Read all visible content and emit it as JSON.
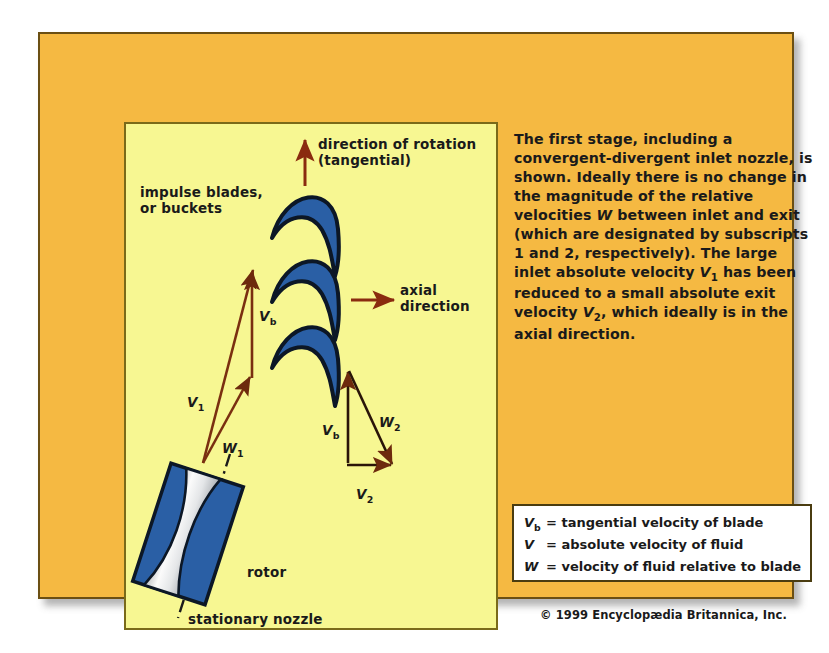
{
  "figure": {
    "colors": {
      "page_background": "#ffffff",
      "outer_panel": "#f5b942",
      "outer_panel_border": "#6b4f13",
      "inner_panel": "#f7f792",
      "inner_panel_border": "#7a6a1a",
      "blade_fill": "#2a5fa5",
      "blade_outline": "#0e1a33",
      "arrow_color": "#8a2b0f",
      "vector_color": "#7a2f10",
      "nozzle_blue": "#2a5fa5",
      "nozzle_white": "#f2f2f2",
      "legend_background": "#ffffff",
      "text_color": "#1a1a1a"
    }
  },
  "diagram": {
    "labels": {
      "rotation_arrow": "direction of rotation\n(tangential)",
      "impulse_blades": "impulse blades,\nor buckets",
      "axial_arrow": "axial\ndirection",
      "rotor": "rotor",
      "stationary_nozzle": "stationary nozzle"
    },
    "vectors": {
      "v1": "V",
      "v1_sub": "1",
      "w1": "W",
      "w1_sub": "1",
      "vb_left": "V",
      "vb_left_sub": "b",
      "vb_right": "V",
      "vb_right_sub": "b",
      "w2": "W",
      "w2_sub": "2",
      "v2": "V",
      "v2_sub": "2"
    },
    "blade_count": 3
  },
  "body": {
    "paragraph": "The first stage, including a convergent-divergent inlet nozzle, is shown. Ideally there is no change in the magnitude of the relative velocities W between inlet and exit (which are designated by subscripts 1 and 2, respectively). The large inlet absolute velocity V1 has been reduced to a small absolute exit velocity V2, which ideally is in the axial direction."
  },
  "legend": {
    "rows": [
      {
        "symbol": "V",
        "subscript": "b",
        "definition": "= tangential velocity of blade"
      },
      {
        "symbol": "V",
        "subscript": "",
        "definition": "= absolute velocity of fluid"
      },
      {
        "symbol": "W",
        "subscript": "",
        "definition": "= velocity of fluid relative to blade"
      }
    ]
  },
  "credit": {
    "text": "© 1999 Encyclopædia Britannica, Inc."
  }
}
